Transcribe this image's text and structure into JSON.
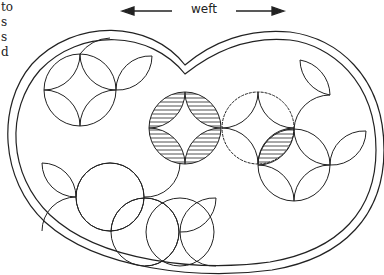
{
  "figure": {
    "direction_label": "weft",
    "side_text_fragments": [
      "to",
      "s",
      "s",
      "d"
    ],
    "colors": {
      "stroke": "#222222",
      "background": "#ffffff"
    },
    "elements": {
      "outer_border": "heart-shaped double-line border",
      "motifs": [
        {
          "name": "top-left circle cluster",
          "style": "outline"
        },
        {
          "name": "center hatched circle",
          "style": "hatched petals"
        },
        {
          "name": "center stitched circle",
          "style": "stitch marks with one hatched petal"
        },
        {
          "name": "right circle cluster",
          "style": "outline"
        },
        {
          "name": "bottom-left interlocking circles",
          "style": "outline"
        }
      ]
    }
  }
}
